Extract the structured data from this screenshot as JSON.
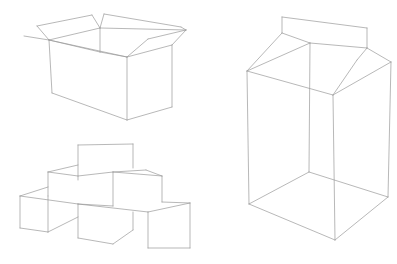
{
  "figure": {
    "background": "#ffffff",
    "line_color": "#9a9a9a",
    "line_width": 0.7,
    "objects": [
      {
        "id": "open-cardboard-box",
        "label": "Open cardboard box",
        "segments": [
          [
            37,
            26,
            92,
            15
          ],
          [
            92,
            15,
            100,
            28
          ],
          [
            37,
            26,
            49,
            40
          ],
          [
            104,
            14,
            181,
            27
          ],
          [
            104,
            14,
            100,
            28
          ],
          [
            181,
            27,
            186,
            30
          ],
          [
            186,
            30,
            148,
            39
          ],
          [
            148,
            39,
            127,
            57
          ],
          [
            24,
            36,
            49,
            40
          ],
          [
            100,
            28,
            186,
            30
          ],
          [
            49,
            40,
            100,
            28
          ],
          [
            100,
            28,
            100,
            52
          ],
          [
            49,
            40,
            127,
            57
          ],
          [
            127,
            57,
            172,
            45
          ],
          [
            172,
            45,
            186,
            30
          ],
          [
            49,
            40,
            52,
            93
          ],
          [
            127,
            57,
            127,
            120
          ],
          [
            172,
            45,
            172,
            107
          ],
          [
            52,
            93,
            127,
            120
          ],
          [
            127,
            120,
            172,
            107
          ],
          [
            49,
            40,
            100,
            52
          ],
          [
            100,
            52,
            127,
            57
          ]
        ]
      },
      {
        "id": "stacked-cubes",
        "label": "Stacked cubes",
        "segments": [
          [
            78,
            145,
            133,
            144
          ],
          [
            78,
            145,
            78,
            180
          ],
          [
            133,
            144,
            133,
            168
          ],
          [
            48,
            172,
            78,
            165
          ],
          [
            48,
            172,
            48,
            196
          ],
          [
            48,
            172,
            78,
            176
          ],
          [
            78,
            176,
            113,
            172
          ],
          [
            113,
            172,
            113,
            206
          ],
          [
            113,
            172,
            146,
            170
          ],
          [
            146,
            170,
            162,
            176
          ],
          [
            113,
            172,
            162,
            176
          ],
          [
            162,
            176,
            162,
            202
          ],
          [
            20,
            196,
            48,
            187
          ],
          [
            20,
            196,
            20,
            228
          ],
          [
            20,
            196,
            78,
            204
          ],
          [
            78,
            204,
            78,
            238
          ],
          [
            78,
            204,
            148,
            212
          ],
          [
            148,
            212,
            148,
            248
          ],
          [
            148,
            212,
            190,
            203
          ],
          [
            190,
            203,
            190,
            248
          ],
          [
            162,
            202,
            190,
            203
          ],
          [
            20,
            228,
            48,
            232
          ],
          [
            48,
            232,
            78,
            217
          ],
          [
            78,
            238,
            113,
            244
          ],
          [
            113,
            244,
            133,
            230
          ],
          [
            133,
            230,
            133,
            212
          ],
          [
            148,
            248,
            190,
            248
          ],
          [
            113,
            206,
            78,
            204
          ],
          [
            48,
            196,
            48,
            232
          ]
        ]
      },
      {
        "id": "milk-carton",
        "label": "Milk carton",
        "segments": [
          [
            282,
            17,
            367,
            28
          ],
          [
            282,
            17,
            282,
            33
          ],
          [
            367,
            28,
            367,
            48
          ],
          [
            282,
            33,
            310,
            43
          ],
          [
            310,
            43,
            367,
            48
          ],
          [
            282,
            33,
            247,
            71
          ],
          [
            247,
            71,
            310,
            43
          ],
          [
            367,
            48,
            391,
            62
          ],
          [
            367,
            48,
            357,
            60
          ],
          [
            357,
            60,
            333,
            95
          ],
          [
            247,
            71,
            333,
            95
          ],
          [
            333,
            95,
            391,
            62
          ],
          [
            310,
            43,
            309,
            172
          ],
          [
            247,
            71,
            249,
            204
          ],
          [
            333,
            95,
            335,
            240
          ],
          [
            391,
            62,
            388,
            197
          ],
          [
            249,
            204,
            335,
            240
          ],
          [
            335,
            240,
            388,
            197
          ],
          [
            249,
            204,
            309,
            172
          ],
          [
            309,
            172,
            388,
            197
          ]
        ]
      }
    ]
  }
}
